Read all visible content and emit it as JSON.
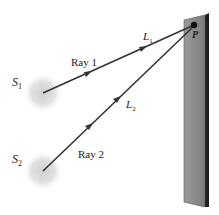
{
  "diagram": {
    "sources": [
      {
        "id": "S1",
        "label": "S",
        "sub": "1",
        "x": 42,
        "y": 93
      },
      {
        "id": "S2",
        "label": "S",
        "sub": "2",
        "x": 42,
        "y": 170
      }
    ],
    "rays": [
      {
        "id": "ray1",
        "label": "Ray 1",
        "path_label": "L",
        "path_sub": "1"
      },
      {
        "id": "ray2",
        "label": "Ray 2",
        "path_label": "L",
        "path_sub": "2"
      }
    ],
    "point": {
      "label": "P"
    },
    "colors": {
      "ray": "#333333",
      "screen_face": "#8a8a8a",
      "screen_edge": "#1f1f1f",
      "source_glow": "#d8d8d8"
    }
  }
}
